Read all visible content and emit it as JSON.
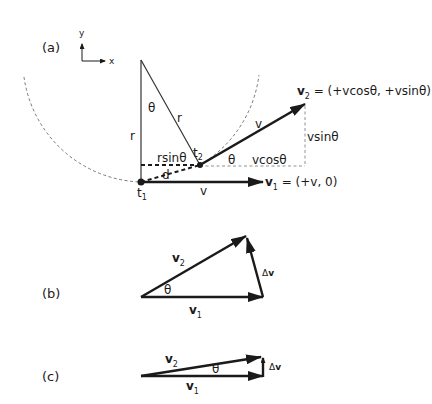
{
  "figure": {
    "panel_a": {
      "label": "(a)",
      "axes": {
        "x": "x",
        "y": "y"
      },
      "labels": {
        "theta_top": "θ",
        "r_left": "r",
        "r_diag": "r",
        "t2": "t",
        "t2_sub": "2",
        "t1": "t",
        "t1_sub": "1",
        "rsin": "rsinθ",
        "d": "d",
        "v_bottom": "v",
        "v_diag": "v",
        "theta_t2": "θ",
        "vcos": "vcosθ",
        "vsin": "vsinθ",
        "v2_name": "v",
        "v2_sub": "2",
        "v2_eq": " = (+vcosθ, +vsinθ)",
        "v1_name": "v",
        "v1_sub": "1",
        "v1_eq": " = (+v, 0)"
      }
    },
    "panel_b": {
      "label": "(b)",
      "labels": {
        "v2": "v",
        "v2_sub": "2",
        "v1": "v",
        "v1_sub": "1",
        "theta": "θ",
        "dv_delta": "Δ",
        "dv_v": "v"
      }
    },
    "panel_c": {
      "label": "(c)",
      "labels": {
        "v2": "v",
        "v2_sub": "2",
        "v1": "v",
        "v1_sub": "1",
        "theta": "θ",
        "dv_delta": "Δ",
        "dv_v": "v"
      }
    },
    "colors": {
      "ink": "#1a1a1a",
      "dashed": "#555555"
    }
  }
}
